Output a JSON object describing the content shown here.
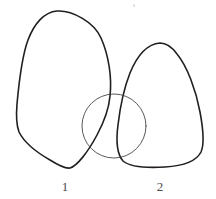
{
  "figure": {
    "background_color": "#ffffff",
    "width": 216,
    "height": 199,
    "blob_stroke_color": "#231f20",
    "blob_stroke_width": 1.6,
    "circle_stroke_color": "#3d3a3b",
    "circle_stroke_width": 0.85,
    "label_color": "#4a4a4a",
    "speck_color": "#dcdcdc"
  },
  "shapes": {
    "left_blob": {
      "name": "left-closed-curve",
      "label": "1",
      "description": "rounded triangular teardrop, apex top-left region",
      "apex": [
        57,
        11
      ],
      "bottom_vertex": [
        70,
        168
      ],
      "left_extreme": [
        17,
        122
      ],
      "path": "M 57 11 C 44 12 34 24 28 40 C 22 56 19 82 17 104 C 16 116 16 124 19 132 C 24 142 36 152 50 160 C 58 165 65 169 70 168 C 77 166 88 152 97 135 C 104 122 109 108 110 96 C 112 78 109 56 101 38 C 94 22 72 10 57 11 Z"
    },
    "right_blob": {
      "name": "right-closed-curve",
      "label": "2",
      "description": "rounded triangular blob, apex upper-right region",
      "apex": [
        160,
        43
      ],
      "bottom_vertex": [
        165,
        167
      ],
      "right_extreme": [
        203,
        130
      ],
      "path": "M 160 43 C 147 44 137 56 130 73 C 124 88 120 108 118 125 C 116 140 117 154 123 161 C 130 167 148 168 165 167 C 182 166 196 162 201 152 C 205 143 203 128 200 112 C 196 90 187 66 177 54 C 172 47 167 43 160 43 Z"
    },
    "circle": {
      "name": "intersecting-circle",
      "center": [
        114,
        126
      ],
      "radius": 32,
      "description": "thin circle overlapping the lower portions of both closed curves"
    },
    "crossing_point": [
      118,
      125
    ]
  },
  "labels": [
    {
      "text": "1",
      "x": 65,
      "y": 180,
      "name": "label-one"
    },
    {
      "text": "2",
      "x": 160,
      "y": 180,
      "name": "label-two"
    }
  ],
  "artifacts": [
    {
      "name": "scan-speck",
      "x": 133,
      "y": 5
    }
  ]
}
